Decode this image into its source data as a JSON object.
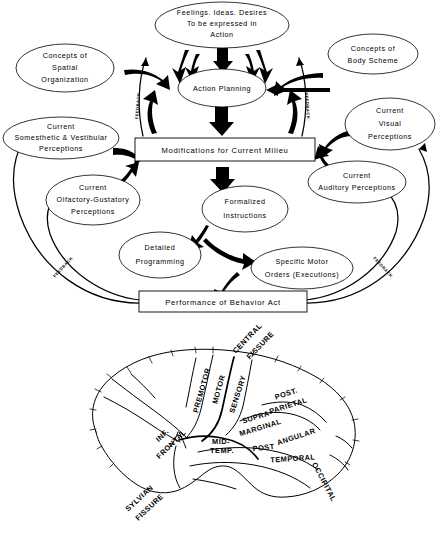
{
  "figure": {
    "kind": "two-panel scientific diagram"
  },
  "flowchart": {
    "nodes": {
      "feelings": {
        "lines": [
          "Feelings. Ideas. Desires",
          "To be expressed in",
          "Action"
        ]
      },
      "concepts_spatial": {
        "lines": [
          "Concepts of",
          "Spatial",
          "Organization"
        ]
      },
      "concepts_body": {
        "lines": [
          "Concepts of",
          "Body  Scheme"
        ]
      },
      "action_planning": {
        "lines": [
          "Action  Planning"
        ]
      },
      "somesthetic": {
        "lines": [
          "Current",
          "Somesthetic  &  Vestibular",
          "Perceptions"
        ]
      },
      "olfactory": {
        "lines": [
          "Current",
          "Olfactory-Gustatory",
          "Perceptions"
        ]
      },
      "visual": {
        "lines": [
          "Current",
          "Visual",
          "Perceptions"
        ]
      },
      "auditory": {
        "lines": [
          "Current",
          "Auditory  Perceptions"
        ]
      },
      "modifications": {
        "lines": [
          "Modifications for  Current  Milieu"
        ]
      },
      "formalized": {
        "lines": [
          "Formalized",
          "Instructions"
        ]
      },
      "detailed": {
        "lines": [
          "Detailed",
          "Programming"
        ]
      },
      "motor_orders": {
        "lines": [
          "Specific  Motor",
          "Orders (Executions)"
        ]
      },
      "performance": {
        "lines": [
          "Performance  of  Behavior  Act"
        ]
      }
    },
    "edge_labels": {
      "feedback_inner_left": "FEEDBACK",
      "feedback_inner_right": "FEEDBACK",
      "feedback_outer_left": "FEEDBACK",
      "feedback_outer_right": "FEEDBACK"
    }
  },
  "brain": {
    "labels": {
      "premotor": "PREMOTOR",
      "motor": "MOTOR",
      "sensory": "SENSORY",
      "central_fissure": [
        "CENTRAL",
        "FISSURE"
      ],
      "post_parietal": [
        "POST.",
        "PARIETAL"
      ],
      "supra_marginal": [
        "SUPRA-",
        "MARGINAL"
      ],
      "angular": "ANGULAR",
      "post": "POST",
      "temporal": "TEMPORAL",
      "occipital": "OCCIPITAL",
      "mid_temp": [
        "MID-",
        "TEMP."
      ],
      "inf_frontal": [
        "INF.",
        "FRONTAL"
      ],
      "sylvian_fissure": [
        "SYLVIAN",
        "FISSURE"
      ]
    }
  },
  "colors": {
    "ink": "#000000",
    "paper": "#ffffff"
  }
}
